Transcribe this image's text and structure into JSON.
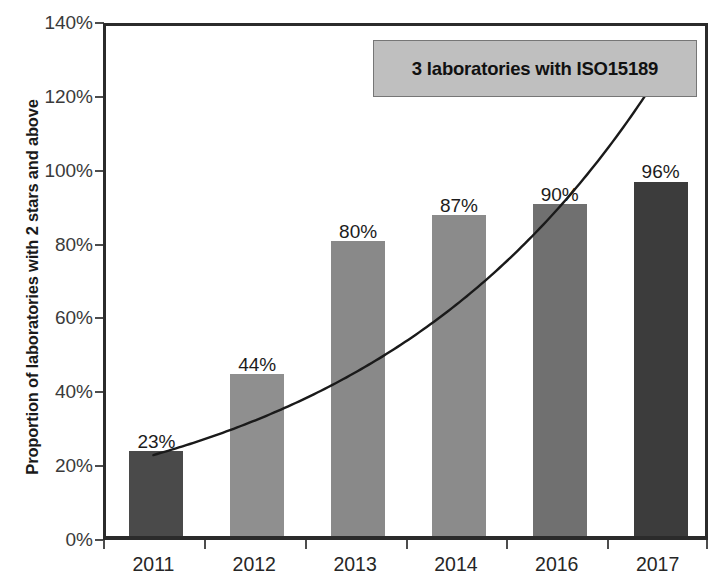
{
  "chart_data": {
    "type": "bar",
    "title": "",
    "subtitle": "",
    "xlabel": "",
    "ylabel": "Proportion of laboratories with 2 stars and above",
    "categories": [
      "2011",
      "2012",
      "2013",
      "2014",
      "2016",
      "2017"
    ],
    "values": [
      23,
      44,
      80,
      87,
      90,
      96
    ],
    "data_labels": [
      "23%",
      "44%",
      "80%",
      "87%",
      "90%",
      "96%"
    ],
    "bar_colors": [
      "#4a4a4a",
      "#8f8f8f",
      "#898989",
      "#8b8b8b",
      "#707070",
      "#3c3c3c"
    ],
    "ylim": [
      0,
      140
    ],
    "ytick_values": [
      0,
      20,
      40,
      60,
      80,
      100,
      120,
      140
    ],
    "ytick_labels": [
      "0%",
      "20%",
      "40%",
      "60%",
      "80%",
      "100%",
      "120%",
      "140%"
    ],
    "grid": false,
    "legend": false,
    "legend_position": "none",
    "annotations": [
      {
        "text": "3 laboratories with ISO15189",
        "style": "boxed-callout",
        "box_fill": "#bfbfbf",
        "box_border": "#767676",
        "text_color": "#111111"
      }
    ],
    "series": [
      {
        "name": "Proportion of laboratories with 2 stars and above",
        "type": "bar",
        "values": [
          23,
          44,
          80,
          87,
          90,
          96
        ]
      },
      {
        "name": "Trend line",
        "type": "line",
        "style": "exponential-trend",
        "color": "#1a1a1a",
        "values": [
          23,
          35,
          52,
          70,
          95,
          128
        ]
      }
    ]
  },
  "axis": {
    "y_title": "Proportion of laboratories with 2 stars and above"
  },
  "annotation": {
    "label": "3 laboratories with ISO15189"
  }
}
